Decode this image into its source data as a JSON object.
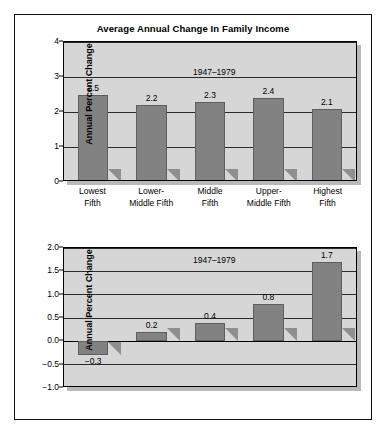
{
  "figure": {
    "title": "Average Annual Change In Family Income",
    "yaxis_title": "Annual Percent Change"
  },
  "chart_data": [
    {
      "type": "bar",
      "id": "top",
      "title": "Average Annual Change In Family Income",
      "annotation": "1947–1979",
      "xlabel": "",
      "ylabel": "Annual Percent Change",
      "categories": [
        "Lowest Fifth",
        "Lower-Middle Fifth",
        "Middle Fifth",
        "Upper-Middle Fifth",
        "Highest Fifth"
      ],
      "category_lines": [
        [
          "Lowest",
          "Fifth"
        ],
        [
          "Lower-",
          "Middle Fifth"
        ],
        [
          "Middle",
          "Fifth"
        ],
        [
          "Upper-",
          "Middle Fifth"
        ],
        [
          "Highest",
          "Fifth"
        ]
      ],
      "values": [
        2.5,
        2.2,
        2.3,
        2.4,
        2.1
      ],
      "value_labels": [
        "2.5",
        "2.2",
        "2.3",
        "2.4",
        "2.1"
      ],
      "ylim": [
        0,
        4
      ],
      "yticks": [
        0,
        1,
        2,
        3,
        4
      ],
      "ytick_labels": [
        "0",
        "1",
        "2",
        "3",
        "4"
      ],
      "grid": true,
      "legend": "none",
      "bar_color": "#828282",
      "plot_bg": "#d6d6d6"
    },
    {
      "type": "bar",
      "id": "bottom",
      "title": "",
      "annotation": "1947–1979",
      "xlabel": "",
      "ylabel": "Annual Percent Change",
      "categories": [
        "Lowest Fifth",
        "Lower-Middle Fifth",
        "Middle Fifth",
        "Upper-Middle Fifth",
        "Highest Fifth"
      ],
      "values": [
        -0.3,
        0.2,
        0.4,
        0.8,
        1.7
      ],
      "value_labels": [
        "−0.3",
        "0.2",
        "0.4",
        "0.8",
        "1.7"
      ],
      "ylim": [
        -1.0,
        2.0
      ],
      "yticks": [
        -1.0,
        -0.5,
        0.0,
        0.5,
        1.0,
        1.5,
        2.0
      ],
      "ytick_labels": [
        "−1.0",
        "−0.5",
        "0.0",
        "0.5",
        "1.0",
        "1.5",
        "2.0"
      ],
      "grid": true,
      "legend": "none",
      "bar_color": "#828282",
      "plot_bg": "#d6d6d6"
    }
  ]
}
